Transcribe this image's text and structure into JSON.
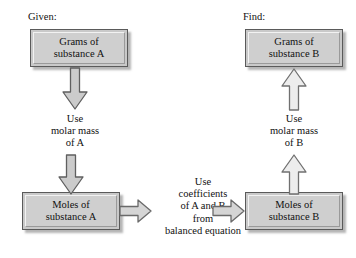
{
  "diagram": {
    "labels": {
      "given": "Given:",
      "find": "Find:"
    },
    "boxes": {
      "grams_a": {
        "line1": "Grams of",
        "line2": "substance A"
      },
      "grams_b": {
        "line1": "Grams of",
        "line2": "substance B"
      },
      "moles_a": {
        "line1": "Moles of",
        "line2": "substance A"
      },
      "moles_b": {
        "line1": "Moles of",
        "line2": "substance B"
      }
    },
    "captions": {
      "molar_mass_a": {
        "line1": "Use",
        "line2": "molar mass",
        "line3": "of A"
      },
      "molar_mass_b": {
        "line1": "Use",
        "line2": "molar mass",
        "line3": "of B"
      },
      "coefficients": {
        "line1": "Use",
        "line2": "coefficients",
        "line3": "of A and B",
        "line4": "from",
        "line5": "balanced equation"
      }
    },
    "arrows": {
      "grams_a_to_molar": "arrow-down",
      "molar_to_moles_a": "arrow-down",
      "moles_a_to_coefficients": "arrow-right",
      "coefficients_to_moles_b": "arrow-right",
      "moles_b_to_molar_b": "arrow-up",
      "molar_b_to_grams_b": "arrow-up"
    },
    "colors": {
      "box_fill": "#cfcfcf",
      "box_border": "#5a5a5a",
      "arrow_fill": "#cccccc",
      "arrow_stroke": "#5f5f5f",
      "text": "#111111",
      "background": "#ffffff"
    }
  }
}
